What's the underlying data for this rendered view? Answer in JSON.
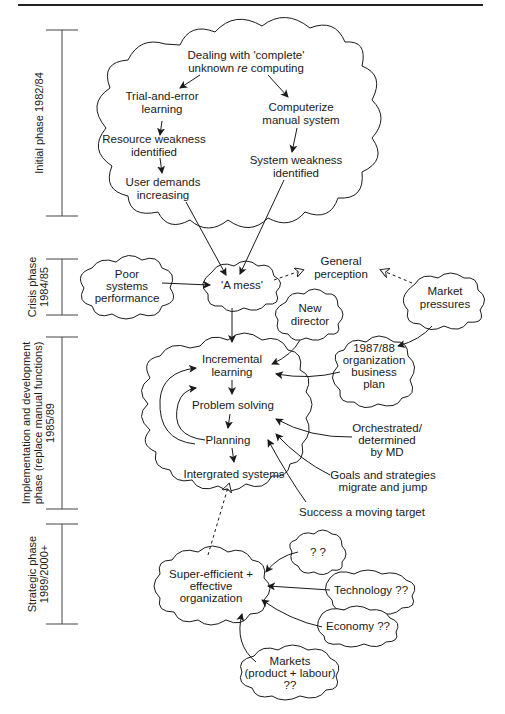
{
  "phases": [
    {
      "id": "initial",
      "label": "Initial phase 1982/84"
    },
    {
      "id": "crisis",
      "line1": "Crisis phase",
      "line2": "1984/85"
    },
    {
      "id": "implementation",
      "line1": "Implementation and development",
      "line2": "phase (replace manual functions)",
      "line3": "1985/89"
    },
    {
      "id": "strategic",
      "line1": "Strategic phase",
      "line2": "1989/2000+"
    }
  ],
  "initial_cloud": {
    "top_line1": "Dealing with 'complete'",
    "top_line2_a": "unknown ",
    "top_line2_em": "re",
    "top_line2_b": " computing",
    "trial_line1": "Trial-and-error",
    "trial_line2": "learning",
    "resource_line1": "Resource weakness",
    "resource_line2": "identified",
    "user_line1": "User demands",
    "user_line2": "increasing",
    "computerize_line1": "Computerize",
    "computerize_line2": "manual system",
    "system_line1": "System weakness",
    "system_line2": "identified"
  },
  "crisis": {
    "poor_line1": "Poor",
    "poor_line2": "systems",
    "poor_line3": "performance",
    "mess": "'A mess'",
    "perception_line1": "General",
    "perception_line2": "perception",
    "market_line1": "Market",
    "market_line2": "pressures"
  },
  "implementation": {
    "director_line1": "New",
    "director_line2": "director",
    "plan_line1": "1987/88",
    "plan_line2": "organization",
    "plan_line3": "business",
    "plan_line4": "plan",
    "incremental_line1": "Incremental",
    "incremental_line2": "learning",
    "problem": "Problem solving",
    "planning": "Planning",
    "integrated": "Intergrated systems",
    "orchestrated_line1": "Orchestrated/",
    "orchestrated_line2": "determined",
    "orchestrated_line3": "by MD",
    "goals_line1": "Goals and strategies",
    "goals_line2": "migrate and jump",
    "success": "Success a moving target"
  },
  "strategic": {
    "super_line1": "Super-efficient +",
    "super_line2": "effective",
    "super_line3": "organization",
    "unknown": "? ?",
    "technology": "Technology ??",
    "economy": "Economy ??",
    "markets_line1": "Markets",
    "markets_line2": "(product + labour)",
    "markets_line3": "??"
  }
}
